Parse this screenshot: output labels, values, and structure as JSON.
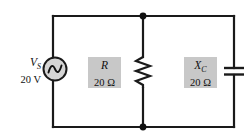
{
  "figure": {
    "background_color": "#ffffff",
    "wire_color": "#1a1a1a",
    "label_box_color": "#c8c8c8",
    "text_color": "#111111"
  },
  "source": {
    "name": "ac-voltage-source",
    "symbol": "V",
    "subscript": "S",
    "value": "20 V",
    "icon": "ac-source-sine-circle-icon"
  },
  "resistor": {
    "name": "resistor",
    "symbol": "R",
    "subscript": "",
    "value": "20 Ω",
    "icon": "resistor-zigzag-icon"
  },
  "capacitor": {
    "name": "capacitive-reactance",
    "symbol": "X",
    "subscript": "C",
    "value": "20 Ω",
    "icon": "capacitor-plates-icon"
  },
  "nodes": {
    "top_junction": "junction-dot",
    "bottom_junction": "junction-dot"
  }
}
